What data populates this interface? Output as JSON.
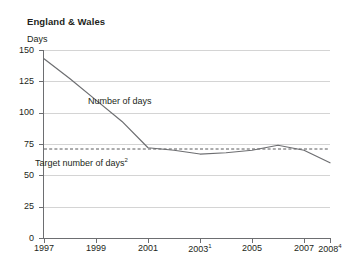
{
  "top_cropped_text": {
    "fragments": [
      "'",
      "·",
      "·",
      "·"
    ]
  },
  "header": {
    "region_title": "England & Wales",
    "unit_label": "Days"
  },
  "annotations": {
    "series_label": "Number of days",
    "target_label": "Target number of days",
    "target_superscript": "2"
  },
  "colors": {
    "line": "#6d6e71",
    "target_line": "#58595b",
    "grid": "#d4d4d4",
    "axis": "#6d6e71",
    "text": "#231f20",
    "background": "#ffffff"
  },
  "chart_data": {
    "type": "line",
    "title": "England & Wales",
    "xlabel": "",
    "ylabel": "Days",
    "ylim": [
      0,
      150
    ],
    "yticks": [
      0,
      25,
      50,
      75,
      100,
      125,
      150
    ],
    "ytick_labels": [
      "0",
      "25",
      "50",
      "75",
      "100",
      "125",
      "150"
    ],
    "xlim": [
      1997,
      2008
    ],
    "xticks": [
      1997,
      1999,
      2001,
      2003,
      2005,
      2007,
      2008
    ],
    "xtick_labels": [
      "1997",
      "1999",
      "2001",
      "2003",
      "2005",
      "2007",
      "2008"
    ],
    "xtick_superscripts": [
      "",
      "",
      "",
      "1",
      "",
      "",
      "4"
    ],
    "grid": true,
    "legend": "none",
    "series": [
      {
        "name": "Number of days",
        "style": "solid",
        "x": [
          1997,
          1998,
          1999,
          2000,
          2001,
          2002,
          2003,
          2004,
          2005,
          2006,
          2007,
          2008
        ],
        "values": [
          143,
          127,
          110,
          93,
          72,
          70,
          67,
          68,
          70,
          74,
          70,
          60
        ]
      },
      {
        "name": "Target number of days",
        "style": "dashed",
        "x": [
          1997,
          2008
        ],
        "values": [
          71,
          71
        ]
      }
    ]
  }
}
